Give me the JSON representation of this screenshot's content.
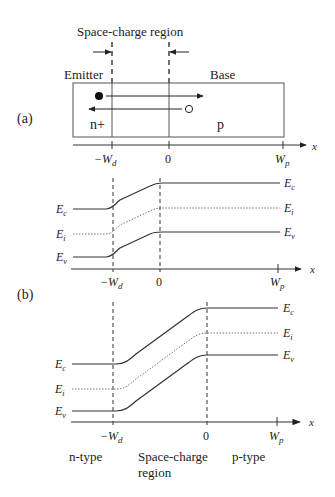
{
  "panel_a": {
    "label": "(a)",
    "top_label": "Space-charge region",
    "emitter_label": "Emitter",
    "base_label": "Base",
    "n_region_label": "n+",
    "p_region_label": "p",
    "axis": {
      "var": "x",
      "ticks": [
        "−W",
        "0",
        "W"
      ],
      "tick_subs": [
        "d",
        "",
        "p"
      ]
    }
  },
  "panel_eq": {
    "left_labels": [
      "E",
      "E",
      "E"
    ],
    "left_subs": [
      "c",
      "i",
      "v"
    ],
    "right_labels": [
      "E",
      "E",
      "E"
    ],
    "right_subs": [
      "c",
      "i",
      "v"
    ],
    "axis": {
      "var": "x",
      "ticks": [
        "−W",
        "0",
        "W"
      ],
      "tick_subs": [
        "d",
        "",
        "p"
      ]
    }
  },
  "panel_b": {
    "label": "(b)",
    "left_labels": [
      "E",
      "E",
      "E"
    ],
    "left_subs": [
      "c",
      "i",
      "v"
    ],
    "right_labels": [
      "E",
      "E",
      "E"
    ],
    "right_subs": [
      "c",
      "i",
      "v"
    ],
    "axis": {
      "var": "x",
      "ticks": [
        "−W",
        "0",
        "W"
      ],
      "tick_subs": [
        "d",
        "",
        "p"
      ]
    },
    "region_labels": [
      "n-type",
      "Space-charge",
      "region",
      "p-type"
    ]
  },
  "colors": {
    "line": "#333333",
    "dotted": "#666666",
    "text": "#222222"
  }
}
